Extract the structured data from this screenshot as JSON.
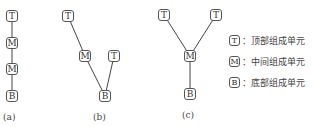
{
  "diagrams": [
    {
      "label": "(a)",
      "nodes": [
        {
          "text": "T",
          "x": 6,
          "y": 10
        },
        {
          "text": "M",
          "x": 6,
          "y": 37
        },
        {
          "text": "M",
          "x": 6,
          "y": 63
        },
        {
          "text": "B",
          "x": 6,
          "y": 90
        }
      ],
      "edges": [
        [
          0,
          1
        ],
        [
          1,
          2
        ],
        [
          2,
          3
        ]
      ],
      "caption_pos": {
        "x": 3,
        "y": 112
      }
    },
    {
      "label": "(b)",
      "nodes": [
        {
          "text": "T",
          "x": 62,
          "y": 10
        },
        {
          "text": "M",
          "x": 79,
          "y": 50
        },
        {
          "text": "T",
          "x": 108,
          "y": 50
        },
        {
          "text": "B",
          "x": 99,
          "y": 90
        }
      ],
      "edges": [
        [
          0,
          1
        ],
        [
          1,
          3
        ],
        [
          2,
          3
        ]
      ],
      "caption_pos": {
        "x": 93,
        "y": 112
      }
    },
    {
      "label": "(c)",
      "nodes": [
        {
          "text": "T",
          "x": 158,
          "y": 9
        },
        {
          "text": "T",
          "x": 210,
          "y": 9
        },
        {
          "text": "M",
          "x": 184,
          "y": 50
        },
        {
          "text": "B",
          "x": 184,
          "y": 88
        }
      ],
      "edges": [
        [
          0,
          2
        ],
        [
          1,
          2
        ],
        [
          2,
          3
        ]
      ],
      "caption_pos": {
        "x": 182,
        "y": 110
      }
    }
  ],
  "legend": [
    {
      "symbol": "T",
      "text": "：顶部组成单元"
    },
    {
      "symbol": "M",
      "text": "：中间组成单元"
    },
    {
      "symbol": "B",
      "text": "：底部组成单元"
    }
  ]
}
